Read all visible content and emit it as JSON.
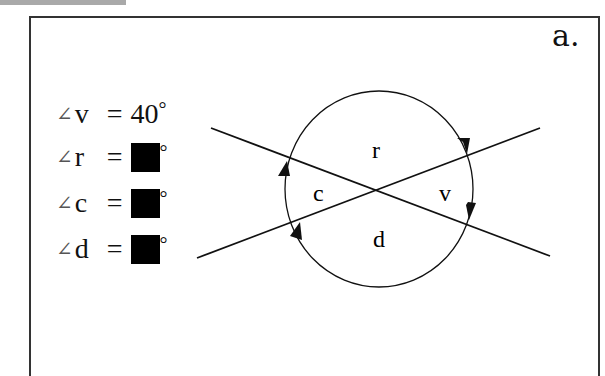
{
  "panel_label": "a.",
  "equations": [
    {
      "angle_symbol": "∠",
      "variable": "v",
      "equals": "=",
      "value": "40",
      "degree": "°",
      "hidden": false
    },
    {
      "angle_symbol": "∠",
      "variable": "r",
      "equals": "=",
      "value": "",
      "degree": "°",
      "hidden": true
    },
    {
      "angle_symbol": "∠",
      "variable": "c",
      "equals": "=",
      "value": "",
      "degree": "°",
      "hidden": true
    },
    {
      "angle_symbol": "∠",
      "variable": "d",
      "equals": "=",
      "value": "",
      "degree": "°",
      "hidden": true
    }
  ],
  "diagram": {
    "region_labels": {
      "top": "r",
      "left": "c",
      "right": "v",
      "bottom": "d"
    },
    "colors": {
      "stroke": "#111111",
      "frame": "#333333",
      "tab": "#a9a9a9"
    }
  }
}
